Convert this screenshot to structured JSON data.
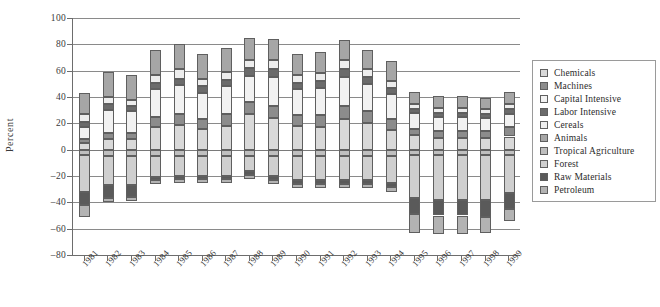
{
  "chart_data": {
    "type": "bar",
    "subtype": "stacked-diverging",
    "title": "",
    "xlabel": "",
    "ylabel": "Percent",
    "ylim": [
      -80,
      100
    ],
    "yticks": [
      100,
      80,
      60,
      40,
      20,
      0,
      -20,
      -40,
      -60,
      -80
    ],
    "ytick_labels": [
      "100",
      "80",
      "60",
      "40",
      "20",
      "0",
      "–20",
      "–40",
      "–60",
      "–80"
    ],
    "grid": true,
    "legend_position": "right",
    "categories": [
      "1981",
      "1982",
      "1983",
      "1984",
      "1985",
      "1986",
      "1987",
      "1988",
      "1989",
      "1990",
      "1991",
      "1992",
      "1993",
      "1994",
      "1995",
      "1996",
      "1997",
      "1998",
      "1999"
    ],
    "series": [
      {
        "name": "Chemicals",
        "color": "#d9d9d9",
        "values": [
          5.0,
          8.0,
          8.0,
          17.0,
          19.0,
          16.0,
          18.0,
          27.0,
          24.0,
          18.0,
          17.0,
          23.0,
          20.0,
          15.0,
          11.0,
          9.0,
          9.0,
          9.0,
          10.0
        ]
      },
      {
        "name": "Machines",
        "color": "#8c8c8c",
        "values": [
          3.0,
          5.0,
          5.0,
          8.0,
          8.0,
          7.0,
          9.0,
          9.0,
          9.0,
          8.0,
          9.0,
          10.0,
          9.0,
          8.0,
          5.0,
          5.0,
          5.0,
          5.0,
          7.0
        ]
      },
      {
        "name": "Capital Intensive",
        "color": "#f2f2f2",
        "values": [
          9.0,
          17.0,
          16.0,
          21.0,
          22.0,
          20.0,
          21.0,
          20.0,
          22.0,
          20.0,
          21.0,
          22.0,
          21.0,
          19.0,
          12.0,
          11.0,
          11.0,
          10.0,
          10.0
        ]
      },
      {
        "name": "Labor Intensive",
        "color": "#6b6b6b",
        "values": [
          4.0,
          5.0,
          4.0,
          5.0,
          5.0,
          5.0,
          5.0,
          6.0,
          6.0,
          5.0,
          5.0,
          6.0,
          5.0,
          5.0,
          3.0,
          3.0,
          3.0,
          3.0,
          4.0
        ]
      },
      {
        "name": "Cereals",
        "color": "#ededed",
        "values": [
          6.0,
          5.0,
          5.0,
          6.0,
          7.0,
          6.0,
          6.0,
          6.0,
          7.0,
          6.0,
          6.0,
          7.0,
          6.0,
          5.0,
          4.0,
          4.0,
          4.0,
          4.0,
          4.0
        ]
      },
      {
        "name": "Animals",
        "color": "#a6a6a6",
        "values": [
          16.0,
          19.0,
          19.0,
          19.0,
          19.0,
          19.0,
          18.0,
          17.0,
          16.0,
          16.0,
          16.0,
          15.0,
          15.0,
          15.0,
          9.0,
          9.0,
          9.0,
          8.0,
          9.0
        ]
      },
      {
        "name": "Tropical Agriculture",
        "color": "#bfbfbf",
        "values": [
          -4.0,
          -5.0,
          -5.0,
          -5.0,
          -5.0,
          -5.0,
          -5.0,
          -5.0,
          -5.0,
          -5.0,
          -5.0,
          -5.0,
          -5.0,
          -5.0,
          -4.0,
          -4.0,
          -4.0,
          -4.0,
          -4.0
        ]
      },
      {
        "name": "Forest",
        "color": "#cfcfcf",
        "values": [
          -28.0,
          -22.0,
          -22.0,
          -16.0,
          -15.0,
          -15.0,
          -15.0,
          -11.0,
          -15.0,
          -18.0,
          -18.0,
          -18.0,
          -18.0,
          -20.0,
          -33.0,
          -34.0,
          -34.0,
          -34.0,
          -29.0
        ]
      },
      {
        "name": "Raw Materials",
        "color": "#5a5a5a",
        "values": [
          -10.0,
          -10.0,
          -9.0,
          -2.0,
          -2.0,
          -2.0,
          -2.0,
          -3.0,
          -3.0,
          -3.0,
          -3.0,
          -3.0,
          -3.0,
          -3.0,
          -12.0,
          -12.0,
          -12.0,
          -13.0,
          -12.0
        ]
      },
      {
        "name": "Petroleum",
        "color": "#b3b3b3",
        "values": [
          -9.0,
          -3.0,
          -3.0,
          -3.0,
          -3.0,
          -3.0,
          -3.0,
          -3.0,
          -3.0,
          -3.0,
          -3.0,
          -3.0,
          -3.0,
          -4.0,
          -14.0,
          -14.0,
          -14.0,
          -12.0,
          -9.0
        ]
      }
    ]
  },
  "legend": {
    "items": [
      {
        "label": "Chemicals",
        "color": "#d9d9d9"
      },
      {
        "label": "Machines",
        "color": "#8c8c8c"
      },
      {
        "label": "Capital Intensive",
        "color": "#f2f2f2"
      },
      {
        "label": "Labor Intensive",
        "color": "#6b6b6b"
      },
      {
        "label": "Cereals",
        "color": "#ededed"
      },
      {
        "label": "Animals",
        "color": "#a6a6a6"
      },
      {
        "label": "Tropical Agriculture",
        "color": "#bfbfbf"
      },
      {
        "label": "Forest",
        "color": "#cfcfcf"
      },
      {
        "label": "Raw Materials",
        "color": "#5a5a5a"
      },
      {
        "label": "Petroleum",
        "color": "#b3b3b3"
      }
    ]
  },
  "colors": {
    "axis": "#6d6d6d",
    "grid": "#8a8a8a",
    "text": "#2b2b2b",
    "background": "#ffffff",
    "segment_border": "#5f5f5f"
  }
}
